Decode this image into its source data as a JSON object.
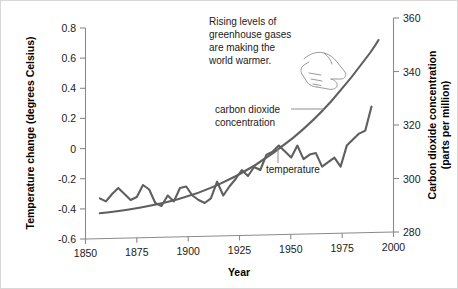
{
  "chart_data": {
    "type": "line",
    "title": "",
    "xlabel": "Year",
    "ylabel": "Temperature change (degrees Celsius)",
    "y2label": "Carbon dioxide concentration (parts per million)",
    "xlim": [
      1850,
      2000
    ],
    "ylim": [
      -0.6,
      0.8
    ],
    "y2lim": [
      280,
      360
    ],
    "grid": false,
    "legend_position": "inline-annotations",
    "x_ticks": [
      1850,
      1875,
      1900,
      1925,
      1950,
      1975,
      2000
    ],
    "x_tick_labels": [
      "1850",
      "1875",
      "1900",
      "1925",
      "1950",
      "1975",
      "2000"
    ],
    "y_ticks": [
      -0.6,
      -0.4,
      -0.2,
      0,
      0.2,
      0.4,
      0.6,
      0.8
    ],
    "y_tick_labels": [
      "-0.6",
      "-0.4",
      "-0.2",
      "0",
      "0.2",
      "0.4",
      "0.6",
      "0.8"
    ],
    "y2_ticks": [
      280,
      300,
      320,
      340,
      360
    ],
    "y2_tick_labels": [
      "280",
      "300",
      "320",
      "340",
      "360"
    ],
    "series": [
      {
        "name": "carbon dioxide concentration",
        "axis": "right",
        "color": "#5f5f5f",
        "x": [
          1857,
          1865,
          1875,
          1885,
          1895,
          1905,
          1915,
          1925,
          1935,
          1945,
          1955,
          1960,
          1965,
          1970,
          1975,
          1980,
          1985,
          1990
        ],
        "values": [
          287.0,
          288.0,
          289.0,
          290.0,
          291.5,
          293.5,
          296.0,
          299.0,
          302.5,
          306.5,
          311.5,
          314.5,
          318.0,
          322.5,
          327.5,
          333.5,
          340.0,
          347.0
        ]
      },
      {
        "name": "temperature",
        "axis": "left",
        "color": "#5f5f5f",
        "x": [
          1857,
          1860,
          1863,
          1866,
          1869,
          1872,
          1875,
          1878,
          1881,
          1884,
          1887,
          1890,
          1893,
          1896,
          1899,
          1902,
          1905,
          1908,
          1911,
          1914,
          1917,
          1920,
          1923,
          1926,
          1929,
          1932,
          1935,
          1938,
          1941,
          1944,
          1947,
          1950,
          1953,
          1956,
          1959,
          1962,
          1965,
          1968,
          1971,
          1974,
          1977,
          1980,
          1983,
          1986,
          1989
        ],
        "values": [
          -0.33,
          -0.35,
          -0.3,
          -0.26,
          -0.3,
          -0.34,
          -0.32,
          -0.24,
          -0.27,
          -0.36,
          -0.38,
          -0.31,
          -0.35,
          -0.26,
          -0.25,
          -0.31,
          -0.34,
          -0.36,
          -0.33,
          -0.22,
          -0.31,
          -0.25,
          -0.2,
          -0.14,
          -0.18,
          -0.12,
          -0.14,
          -0.04,
          -0.02,
          0.02,
          -0.02,
          -0.06,
          0.02,
          -0.07,
          -0.04,
          -0.03,
          -0.12,
          -0.09,
          -0.06,
          -0.12,
          0.02,
          0.06,
          0.1,
          0.12,
          0.28
        ]
      }
    ],
    "annotations": [
      {
        "name": "greenhouse-callout",
        "lines": [
          "Rising levels of",
          "greenhouse gases",
          "are making the",
          "world warmer."
        ],
        "icon": "pointing-hand-icon"
      },
      {
        "name": "co2-series-label",
        "lines": [
          "carbon dioxide",
          "concentration"
        ]
      },
      {
        "name": "temperature-series-label",
        "lines": [
          "temperature"
        ]
      }
    ]
  }
}
